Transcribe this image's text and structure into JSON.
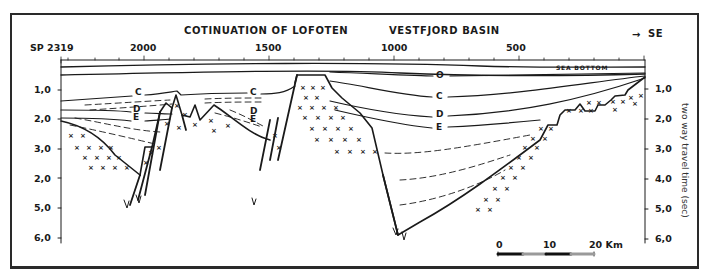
{
  "header": {
    "title_left": "COTINUATION OF LOFOTEN",
    "title_right": "VESTFJORD BASIN",
    "direction": "SE",
    "direction_icon": "arrow-right-icon"
  },
  "shotpoint_axis": {
    "start_label": "SP 2319",
    "ticks": [
      "2000",
      "1500",
      "1000",
      "500"
    ]
  },
  "left_time_axis": {
    "labels": [
      "1,0",
      "2,0",
      "3,0",
      "2,0",
      "5,0",
      "6,0"
    ]
  },
  "right_time_axis": {
    "labels": [
      "1,0",
      "2,0",
      "3,0",
      "4,0",
      "5,0",
      "6,0"
    ],
    "title": "two way travel time (sec)"
  },
  "horizons": {
    "sea_bottom": "SEA BOTTOM",
    "labels": [
      "O",
      "C",
      "D",
      "E"
    ],
    "left_c": "C",
    "left_d": "D",
    "left_e": "E",
    "mid_c": "C",
    "mid_d": "D",
    "mid_e": "E",
    "right_o": "O",
    "right_c": "C",
    "right_d": "D",
    "right_e": "E"
  },
  "scale_bar": {
    "ticks": [
      "0",
      "10",
      "20 Km"
    ],
    "colors": {
      "dark": "#111111",
      "light": "#9a9a9a"
    }
  },
  "colors": {
    "ink": "#1a1a1a",
    "frame": "#2a2a2a",
    "background": "#ffffff"
  }
}
